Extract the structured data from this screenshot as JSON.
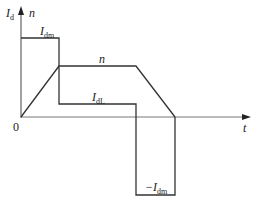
{
  "diagram": {
    "y_axis_labels": {
      "current": "I",
      "current_sub": "d",
      "speed": "n"
    },
    "x_axis_label": "t",
    "origin_label": "0",
    "curves": {
      "Idm": {
        "label": "I",
        "sub": "dm"
      },
      "n": {
        "label": "n"
      },
      "IdL": {
        "label": "I",
        "sub": "dL"
      },
      "neg_Idm": {
        "label": "−I",
        "sub": "dm"
      }
    },
    "colors": {
      "line": "#333333",
      "axis": "#555555"
    }
  }
}
